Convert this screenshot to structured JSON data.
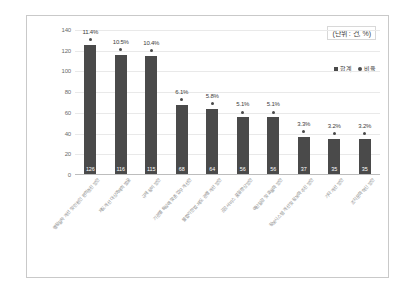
{
  "chart_data": {
    "type": "bar",
    "title": "",
    "subtitle": "",
    "xlabel": "",
    "ylabel": "",
    "ylim": [
      0,
      140
    ],
    "ytick_step": 20,
    "yticks": [
      "140",
      "120",
      "100",
      "80",
      "60",
      "40",
      "20",
      "0"
    ],
    "grid": true,
    "legend_position": "top-right",
    "unit_note": "(단위 : 건, %)",
    "bar_color": "#4a4a4a",
    "marker_color": "#4a4a4a",
    "categories": [
      "행정절차 개선 및 민원인 편의증진 방안",
      "제도개선 대상과제의 발굴",
      "규제 정비 방안",
      "기관별 특성에 맞춘 업무 개선안",
      "불합리한 법·제도 관행 개선 방안",
      "공공서비스 품질 향상방안",
      "예산절감 및 효율화 방안",
      "정보시스템 개선 및 정보화 추진 방안",
      "기타 개선 방안",
      "조직문화 혁신 방안"
    ],
    "series": [
      {
        "name": "합계",
        "type": "bar",
        "values": [
          126,
          116,
          115,
          68,
          64,
          56,
          56,
          37,
          35,
          35
        ],
        "labels": [
          "126",
          "116",
          "115",
          "68",
          "64",
          "56",
          "56",
          "37",
          "35",
          "35"
        ]
      },
      {
        "name": "비율",
        "type": "scatter",
        "values": [
          11.4,
          10.5,
          10.4,
          6.1,
          5.8,
          5.1,
          5.1,
          3.3,
          3.2,
          3.2
        ],
        "labels": [
          "11.4%",
          "10.5%",
          "10.4%",
          "6.1%",
          "5.8%",
          "5.1%",
          "5.1%",
          "3.3%",
          "3.2%",
          "3.2%"
        ]
      }
    ]
  },
  "legend": {
    "items": [
      {
        "label": "합계",
        "marker": "square"
      },
      {
        "label": "비율",
        "marker": "dot"
      }
    ]
  }
}
